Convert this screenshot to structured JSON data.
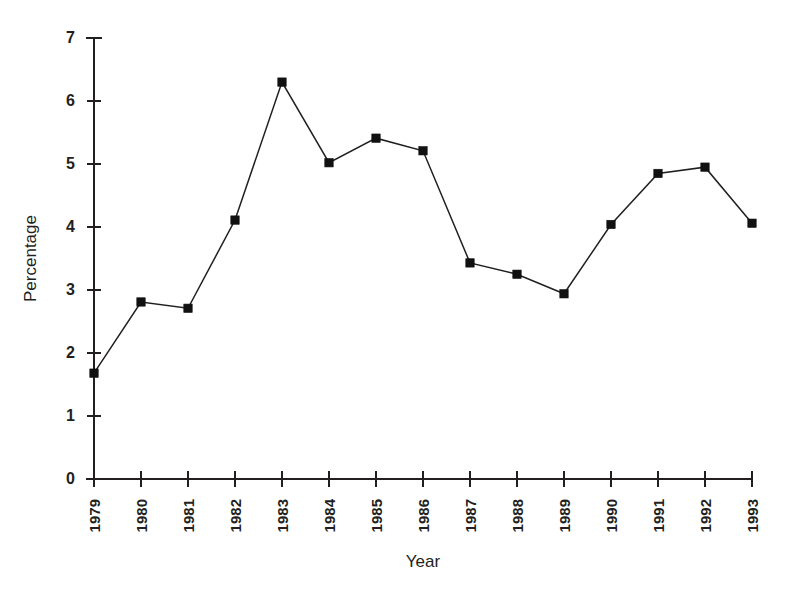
{
  "chart_data": {
    "type": "line",
    "title": "",
    "xlabel": "Year",
    "ylabel": "Percentage",
    "categories": [
      "1979",
      "1980",
      "1981",
      "1982",
      "1983",
      "1984",
      "1985",
      "1986",
      "1987",
      "1988",
      "1989",
      "1990",
      "1991",
      "1992",
      "1993"
    ],
    "values": [
      1.68,
      2.81,
      2.71,
      4.11,
      6.3,
      5.02,
      5.41,
      5.21,
      3.43,
      3.25,
      2.94,
      4.04,
      4.85,
      4.95,
      4.06
    ],
    "series": [
      {
        "name": "Percentage",
        "values": [
          1.68,
          2.81,
          2.71,
          4.11,
          6.3,
          5.02,
          5.41,
          5.21,
          3.43,
          3.25,
          2.94,
          4.04,
          4.85,
          4.95,
          4.06
        ]
      }
    ],
    "ylim": [
      0,
      7
    ],
    "ytick_labels": [
      "0",
      "1",
      "2",
      "3",
      "4",
      "5",
      "6",
      "7"
    ],
    "ytick_values": [
      0,
      1,
      2,
      3,
      4,
      5,
      6,
      7
    ],
    "xtick_labels": [
      "1979",
      "1980",
      "1981",
      "1982",
      "1983",
      "1984",
      "1985",
      "1986",
      "1987",
      "1988",
      "1989",
      "1990",
      "1991",
      "1992",
      "1993"
    ],
    "grid": false,
    "legend": "none",
    "marker": "filled-square",
    "line_color": "#231f20",
    "marker_color": "#111111",
    "background_color": "#ffffff",
    "xtick_label_rotation": -90,
    "ylabel_rotation": -90
  }
}
